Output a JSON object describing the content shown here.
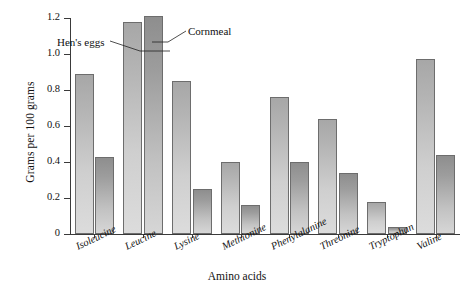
{
  "chart_data": {
    "type": "bar",
    "title": "",
    "xlabel": "Amino acids",
    "ylabel": "Grams per 100 grams",
    "categories": [
      "Isoleucine",
      "Leucine",
      "Lysine",
      "Methionine",
      "Phenylalanine",
      "Threonine",
      "Tryptophan",
      "Valine"
    ],
    "series": [
      {
        "name": "Hen's eggs",
        "values": [
          0.89,
          1.18,
          0.85,
          0.4,
          0.76,
          0.64,
          0.18,
          0.97
        ]
      },
      {
        "name": "Cornmeal",
        "values": [
          0.43,
          1.21,
          0.25,
          0.16,
          0.4,
          0.34,
          0.04,
          0.44
        ]
      }
    ],
    "ylim": [
      0,
      1.2
    ],
    "yticks": [
      "0",
      "0.2",
      "0.4",
      "0.6",
      "0.8",
      "1.0",
      "1.2"
    ],
    "ytick_values": [
      0,
      0.2,
      0.4,
      0.6,
      0.8,
      1.0,
      1.2
    ],
    "grid": false,
    "legend": "annotations",
    "annotations": [
      {
        "text": "Hen's eggs",
        "target_series": "Hen's eggs",
        "target_category": "Leucine"
      },
      {
        "text": "Cornmeal",
        "target_series": "Cornmeal",
        "target_category": "Leucine"
      }
    ],
    "colors": {
      "hens_eggs": "#c4c4c4",
      "cornmeal": "#aaaaaa",
      "axis": "#3a3a3a",
      "background": "#ffffff"
    }
  }
}
